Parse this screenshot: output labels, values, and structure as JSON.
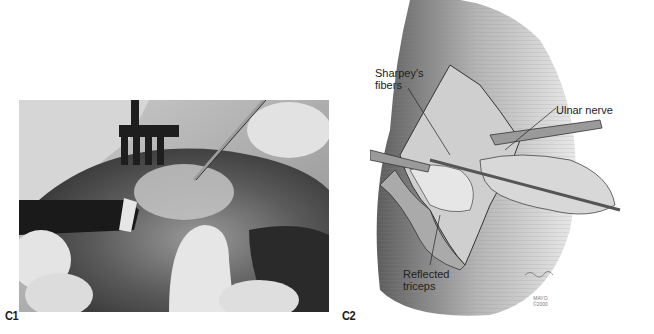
{
  "figure": {
    "panels": [
      {
        "id": "C1",
        "label": "C1",
        "type": "photograph",
        "description": "Intraoperative photograph: retractors and forceps exposing tissue"
      },
      {
        "id": "C2",
        "label": "C2",
        "type": "illustration",
        "description": "Surgical illustration of elbow exposure with labeled structures",
        "annotations": [
          {
            "id": "sharpey",
            "text": "Sharpey's fibers"
          },
          {
            "id": "ulnar",
            "text": "Ulnar nerve"
          },
          {
            "id": "triceps",
            "text": "Reflected triceps"
          }
        ],
        "credit": {
          "line1": "MAYO",
          "line2": "©2000"
        }
      }
    ],
    "colors": {
      "background": "#ffffff",
      "label_text": "#1a1a1a",
      "photo_tone": "#6a6a6a",
      "illustration_tone": "#9a9a9a"
    }
  }
}
